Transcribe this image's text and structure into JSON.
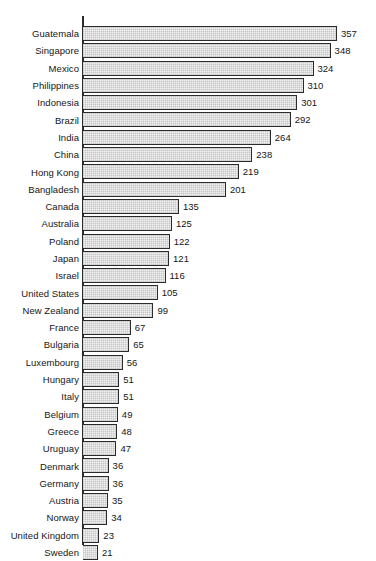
{
  "chart_data": {
    "type": "bar",
    "orientation": "horizontal",
    "title": "",
    "subtitle": "",
    "xlabel": "",
    "ylabel": "",
    "xlim": [
      0,
      357
    ],
    "grid": false,
    "legend": null,
    "axis_line": true,
    "tick_labels": [],
    "value_labels_shown": true,
    "categories": [
      "Guatemala",
      "Singapore",
      "Mexico",
      "Philippines",
      "Indonesia",
      "Brazil",
      "India",
      "China",
      "Hong Kong",
      "Bangladesh",
      "Canada",
      "Australia",
      "Poland",
      "Japan",
      "Israel",
      "United States",
      "New Zealand",
      "France",
      "Bulgaria",
      "Luxembourg",
      "Hungary",
      "Italy",
      "Belgium",
      "Greece",
      "Uruguay",
      "Denmark",
      "Germany",
      "Austria",
      "Norway",
      "United Kingdom",
      "Sweden"
    ],
    "values": [
      357,
      348,
      324,
      310,
      301,
      292,
      264,
      238,
      219,
      201,
      135,
      125,
      122,
      121,
      116,
      105,
      99,
      67,
      65,
      56,
      51,
      51,
      49,
      48,
      47,
      36,
      36,
      35,
      34,
      23,
      21
    ],
    "colors": {
      "bar_fill": "#f1f1f1",
      "bar_border": "#2b2b2b",
      "axis": "#2b2b2b",
      "text": "#161616",
      "background": "#ffffff"
    }
  }
}
